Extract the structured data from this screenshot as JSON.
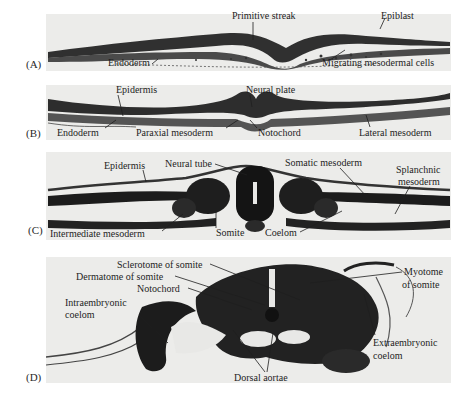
{
  "figure": {
    "panels": [
      {
        "id": "A",
        "letter": "(A)",
        "labels": {
          "primitive_streak": "Primitive streak",
          "epiblast": "Epiblast",
          "endoderm": "Endoderm",
          "migrating_mesodermal_cells": "Migrating mesodermal cells"
        }
      },
      {
        "id": "B",
        "letter": "(B)",
        "labels": {
          "epidermis": "Epidermis",
          "neural_plate": "Neural plate",
          "endoderm": "Endoderm",
          "paraxial_mesoderm": "Paraxial mesoderm",
          "notochord": "Notochord",
          "lateral_mesoderm": "Lateral mesoderm"
        }
      },
      {
        "id": "C",
        "letter": "(C)",
        "labels": {
          "epidermis": "Epidermis",
          "neural_tube": "Neural tube",
          "somatic_mesoderm": "Somatic mesoderm",
          "splanchnic_mesoderm_1": "Splanchnic",
          "splanchnic_mesoderm_2": "mesoderm",
          "intermediate_mesoderm": "Intermediate mesoderm",
          "somite": "Somite",
          "coelom": "Coelom"
        }
      },
      {
        "id": "D",
        "letter": "(D)",
        "labels": {
          "sclerotome": "Sclerotome of somite",
          "dermatome": "Dermatome of somite",
          "notochord": "Notochord",
          "intraembryonic_1": "Intraembryonic",
          "intraembryonic_2": "coelom",
          "myotome_1": "Myotome",
          "myotome_2": "of somite",
          "extraembryonic_1": "Extraembryonic",
          "extraembryonic_2": "coelom",
          "dorsal_aortae": "Dorsal aortae"
        }
      }
    ],
    "colors": {
      "panel_bg": "#ececea",
      "tissue_dark": "#1c1c1c",
      "tissue_mid": "#4a4a4a",
      "label_text": "#1e1e1e"
    }
  }
}
